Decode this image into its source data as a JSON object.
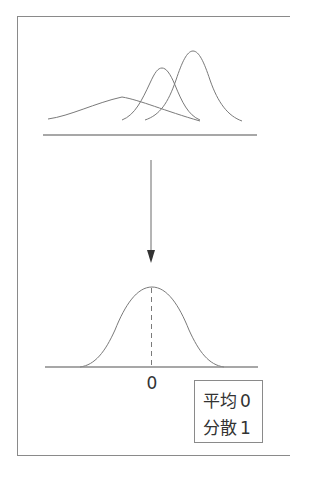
{
  "diagram": {
    "top_panel": {
      "curves": [
        {
          "name": "wide-low-curve",
          "peak_x": 122,
          "peak_y": 97,
          "start_x": 48,
          "end_x": 200
        },
        {
          "name": "middle-curve",
          "peak_x": 162,
          "peak_y": 68,
          "start_x": 122,
          "end_x": 200
        },
        {
          "name": "tall-right-curve",
          "peak_x": 193,
          "peak_y": 51,
          "start_x": 145,
          "end_x": 242
        }
      ]
    },
    "arrow": {
      "direction": "down"
    },
    "bottom_panel": {
      "axis_label": "0",
      "mean_marker": "dashed"
    },
    "legend": {
      "mean_label": "平均",
      "mean_value": "0",
      "variance_label": "分散",
      "variance_value": "1"
    },
    "colors": {
      "line": "#7a7a7a",
      "text": "#333333",
      "background": "#ffffff"
    }
  }
}
